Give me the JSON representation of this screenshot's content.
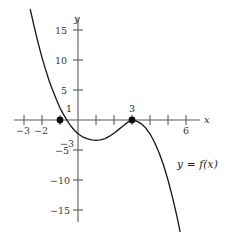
{
  "figure": {
    "axis_labels": {
      "x": "x",
      "y": "y"
    },
    "curve_label": "y = f(x)"
  },
  "chart_data": {
    "type": "line",
    "title": "",
    "xlabel": "x",
    "ylabel": "y",
    "xlim": [
      -3.9,
      6.8
    ],
    "ylim": [
      -16.5,
      17.5
    ],
    "grid": false,
    "legend": "none",
    "x_ticks": [
      -3,
      -2,
      -1,
      0,
      1,
      2,
      3,
      4,
      5,
      6
    ],
    "x_tick_labels": [
      "−3",
      "−2",
      "",
      "",
      "",
      "",
      "",
      "",
      "",
      "6"
    ],
    "y_ticks": [
      15,
      10,
      5,
      1,
      -3,
      -5,
      -10,
      -15
    ],
    "y_tick_labels": [
      "15",
      "10",
      "5",
      "1",
      "−3",
      "−5",
      "−10",
      "−15"
    ],
    "annotations": [
      {
        "text": "1",
        "x": -0.45,
        "y": 1.6,
        "role": "y-axis-tick-label"
      },
      {
        "text": "−3",
        "x": -0.45,
        "y": -3.1,
        "role": "y-axis-tick-label"
      },
      {
        "text": "3",
        "x": 3.0,
        "y": 2.1,
        "role": "point-label"
      },
      {
        "text": "y = f(x)",
        "x": 4.8,
        "y": -7.5,
        "role": "curve-label"
      }
    ],
    "marked_points": [
      {
        "x": -1,
        "y": 0,
        "label": "",
        "style": "filled-dot"
      },
      {
        "x": 3,
        "y": 0,
        "label": "3",
        "style": "filled-dot"
      }
    ],
    "series": [
      {
        "name": "f",
        "description": "cubic with simple root at x = -1 and double root at x = 3, opening downward",
        "roots": [
          -1,
          3
        ],
        "local_minimum": {
          "x": 0.333,
          "y": -3.3
        },
        "local_maximum": {
          "x": 3,
          "y": 0
        },
        "x": [
          -2.65,
          -2.4,
          -2.2,
          -2.0,
          -1.8,
          -1.6,
          -1.4,
          -1.2,
          -1.0,
          -0.8,
          -0.6,
          -0.4,
          -0.2,
          0.0,
          0.25,
          0.5,
          0.75,
          1.0,
          1.25,
          1.5,
          1.75,
          2.0,
          2.25,
          2.5,
          2.75,
          3.0,
          3.25,
          3.5,
          3.75,
          4.0,
          4.25,
          4.5,
          4.75,
          5.0,
          5.25,
          5.5,
          5.75,
          5.95
        ],
        "y": [
          18.4,
          15.1,
          12.7,
          10.4,
          8.4,
          6.5,
          4.9,
          3.4,
          2.0,
          0.9,
          -0.1,
          -1.0,
          -1.7,
          -2.3,
          -2.8,
          -3.1,
          -3.3,
          -3.4,
          -3.3,
          -3.1,
          -2.7,
          -2.2,
          -1.6,
          -1.0,
          -0.4,
          0.0,
          -0.2,
          -0.6,
          -1.3,
          -2.3,
          -3.7,
          -5.4,
          -7.5,
          -10.0,
          -12.9,
          -16.1,
          -19.8,
          -22.3
        ],
        "color": "#1a1a1a"
      }
    ],
    "axis_color": "#5a5a5a",
    "point_color": "#0d0d0d"
  }
}
